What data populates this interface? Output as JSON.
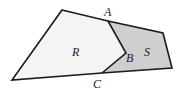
{
  "diagram": {
    "regions": [
      {
        "name": "R",
        "label": "R",
        "fill": "#f4f4f2"
      },
      {
        "name": "S",
        "label": "S",
        "fill": "#cfcfcf"
      }
    ],
    "points": [
      {
        "name": "A",
        "label": "A"
      },
      {
        "name": "B",
        "label": "B"
      },
      {
        "name": "C",
        "label": "C"
      }
    ],
    "stroke_color": "#1a1a1a"
  }
}
